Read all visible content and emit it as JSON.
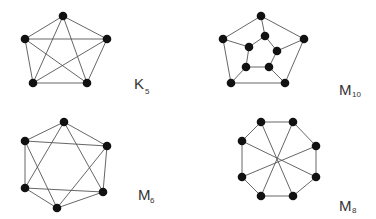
{
  "figure": {
    "background": "#ffffff",
    "node_color": "#111111",
    "edge_color": "#555555",
    "graphs": [
      {
        "id": "K5",
        "label": "K",
        "subscript": "5",
        "label_pos": [
          134,
          89
        ],
        "sub_pos": [
          145,
          94
        ],
        "nodes": [
          [
            63,
            16
          ],
          [
            25,
            39
          ],
          [
            107,
            39
          ],
          [
            33,
            83
          ],
          [
            87,
            83
          ]
        ],
        "edges": [
          [
            0,
            1
          ],
          [
            0,
            2
          ],
          [
            0,
            3
          ],
          [
            0,
            4
          ],
          [
            1,
            2
          ],
          [
            1,
            3
          ],
          [
            1,
            4
          ],
          [
            2,
            3
          ],
          [
            2,
            4
          ],
          [
            3,
            4
          ]
        ]
      },
      {
        "id": "M10",
        "label": "M",
        "subscript": "10",
        "label_pos": [
          339,
          95
        ],
        "sub_pos": [
          352,
          97
        ],
        "nodes": [
          [
            261,
            16
          ],
          [
            223,
            39
          ],
          [
            304,
            39
          ],
          [
            231,
            83
          ],
          [
            285,
            83
          ],
          [
            265,
            36
          ],
          [
            249,
            47
          ],
          [
            277,
            51
          ],
          [
            246,
            67
          ],
          [
            269,
            67
          ]
        ],
        "edges": [
          [
            0,
            1
          ],
          [
            0,
            2
          ],
          [
            1,
            3
          ],
          [
            2,
            4
          ],
          [
            3,
            4
          ],
          [
            0,
            5
          ],
          [
            1,
            6
          ],
          [
            2,
            7
          ],
          [
            3,
            8
          ],
          [
            4,
            9
          ],
          [
            5,
            6
          ],
          [
            5,
            7
          ],
          [
            6,
            8
          ],
          [
            7,
            9
          ],
          [
            8,
            9
          ]
        ]
      },
      {
        "id": "M6",
        "label": "M",
        "subscript": "6",
        "label_pos": [
          138,
          200
        ],
        "sub_pos": [
          150,
          203
        ],
        "nodes": [
          [
            64,
            122
          ],
          [
            25,
            141
          ],
          [
            107,
            146
          ],
          [
            25,
            188
          ],
          [
            103,
            192
          ],
          [
            57,
            208
          ]
        ],
        "edges": [
          [
            0,
            1
          ],
          [
            0,
            2
          ],
          [
            1,
            3
          ],
          [
            2,
            4
          ],
          [
            3,
            5
          ],
          [
            4,
            5
          ],
          [
            1,
            2
          ],
          [
            3,
            4
          ],
          [
            0,
            3
          ],
          [
            0,
            4
          ],
          [
            1,
            5
          ],
          [
            2,
            5
          ]
        ]
      },
      {
        "id": "M8",
        "label": "M",
        "subscript": "8",
        "label_pos": [
          339,
          211
        ],
        "sub_pos": [
          352,
          213
        ],
        "nodes": [
          [
            261,
            122
          ],
          [
            293,
            122
          ],
          [
            316,
            146
          ],
          [
            316,
            177
          ],
          [
            293,
            196
          ],
          [
            261,
            196
          ],
          [
            242,
            177
          ],
          [
            242,
            141
          ]
        ],
        "edges": [
          [
            0,
            1
          ],
          [
            1,
            2
          ],
          [
            2,
            3
          ],
          [
            3,
            4
          ],
          [
            4,
            5
          ],
          [
            5,
            6
          ],
          [
            6,
            7
          ],
          [
            7,
            0
          ],
          [
            0,
            4
          ],
          [
            1,
            5
          ],
          [
            2,
            6
          ],
          [
            3,
            7
          ]
        ]
      }
    ]
  }
}
